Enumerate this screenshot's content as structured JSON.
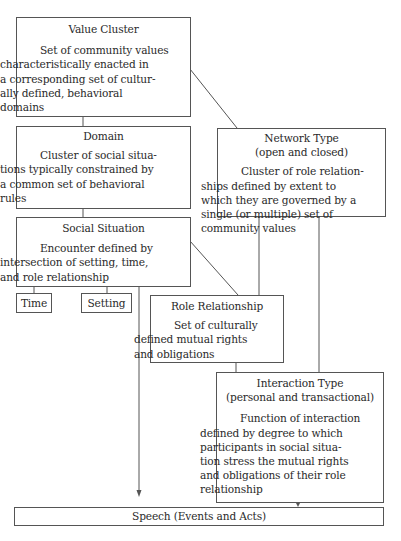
{
  "diagram": {
    "nodes": {
      "value_cluster": {
        "title": "Value Cluster",
        "description": [
          "Set of community values",
          "characteristically enacted in",
          "a corresponding set of cultur-",
          "ally defined, behavioral",
          "domains"
        ]
      },
      "domain": {
        "title": "Domain",
        "description": [
          "Cluster of social situa-",
          "tions typically constrained by",
          "a common set of behavioral",
          "rules"
        ]
      },
      "social_situation": {
        "title": "Social Situation",
        "description": [
          "Encounter defined by",
          "intersection of setting, time,",
          "and role relationship"
        ]
      },
      "time": {
        "title": "Time"
      },
      "setting": {
        "title": "Setting"
      },
      "network_type": {
        "title": "Network Type",
        "subtitle": "(open and closed)",
        "description": [
          "Cluster of role relation-",
          "ships defined by extent to",
          "which they are governed by a",
          "single (or multiple) set of",
          "community values"
        ]
      },
      "role_relationship": {
        "title": "Role Relationship",
        "description": [
          "Set of culturally",
          "defined mutual rights",
          "and obligations"
        ]
      },
      "interaction_type": {
        "title": "Interaction Type",
        "subtitle": "(personal and transactional)",
        "description": [
          "Function of interaction",
          "defined by degree to which",
          "participants in social situa-",
          "tion stress the mutual rights",
          "and obligations of their role",
          "relationship"
        ]
      },
      "speech": {
        "title": "Speech (Events and Acts)"
      }
    },
    "edges": [
      {
        "from": "Value Cluster",
        "to": "Domain"
      },
      {
        "from": "Value Cluster",
        "to": "Network Type"
      },
      {
        "from": "Domain",
        "to": "Social Situation"
      },
      {
        "from": "Social Situation",
        "to": "Time"
      },
      {
        "from": "Social Situation",
        "to": "Setting"
      },
      {
        "from": "Social Situation",
        "to": "Role Relationship"
      },
      {
        "from": "Social Situation",
        "to": "Speech (Events and Acts)",
        "arrow": true
      },
      {
        "from": "Network Type",
        "to": "Role Relationship"
      },
      {
        "from": "Network Type",
        "to": "Interaction Type"
      },
      {
        "from": "Role Relationship",
        "to": "Interaction Type"
      },
      {
        "from": "Interaction Type",
        "to": "Speech (Events and Acts)",
        "arrow": true
      }
    ],
    "colors": {
      "line": "#555555",
      "text": "#2a2a2a",
      "background": "#ffffff"
    }
  }
}
